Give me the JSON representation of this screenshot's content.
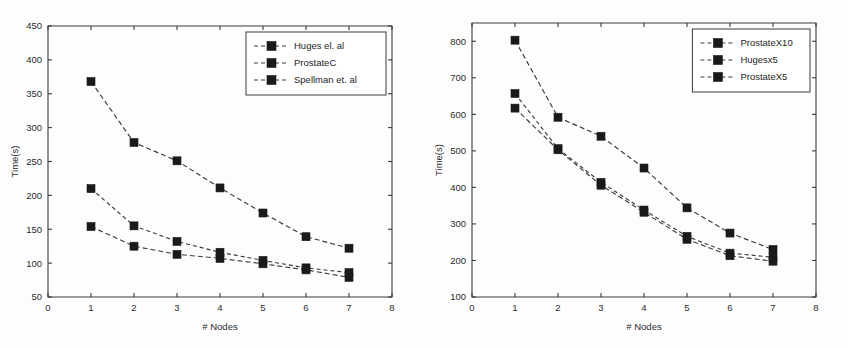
{
  "figure": {
    "background": "#fdfdfd",
    "panel_count": 2
  },
  "chart_data": [
    {
      "id": "left",
      "type": "line",
      "title": "",
      "subtitle": "",
      "xlabel": "# Nodes",
      "ylabel": "Time(s)",
      "xlim": [
        0,
        8
      ],
      "ylim": [
        50,
        450
      ],
      "xticks": [
        0,
        1,
        2,
        3,
        4,
        5,
        6,
        7,
        8
      ],
      "xtick_labels": [
        "0",
        "1",
        "2",
        "3",
        "4",
        "5",
        "6",
        "7",
        "8"
      ],
      "yticks": [
        50,
        100,
        150,
        200,
        250,
        300,
        350,
        400,
        450
      ],
      "ytick_labels": [
        "50",
        "100",
        "150",
        "200",
        "250",
        "300",
        "350",
        "400",
        "450"
      ],
      "grid": false,
      "legend_position": "top-right",
      "x": [
        1,
        2,
        3,
        4,
        5,
        6,
        7
      ],
      "series": [
        {
          "name": "Huges el. al",
          "color": "#3b3b3b",
          "linestyle": "dashed",
          "marker": "square",
          "values": [
            154,
            125,
            113,
            107,
            99,
            90,
            79
          ]
        },
        {
          "name": "ProstateC",
          "color": "#3b3b3b",
          "linestyle": "dashed",
          "marker": "square",
          "values": [
            210,
            155,
            132,
            116,
            104,
            93,
            86
          ]
        },
        {
          "name": "Spellman et. al",
          "color": "#3b3b3b",
          "linestyle": "dashed",
          "marker": "square",
          "values": [
            368,
            278,
            251,
            211,
            174,
            139,
            122
          ]
        }
      ]
    },
    {
      "id": "right",
      "type": "line",
      "title": "",
      "subtitle": "",
      "xlabel": "# Nodes",
      "ylabel": "Time(s)",
      "xlim": [
        0,
        8
      ],
      "ylim": [
        100,
        850
      ],
      "xticks": [
        0,
        1,
        2,
        3,
        4,
        5,
        6,
        7,
        8
      ],
      "xtick_labels": [
        "0",
        "1",
        "2",
        "3",
        "4",
        "5",
        "6",
        "7",
        "8"
      ],
      "yticks": [
        100,
        200,
        300,
        400,
        500,
        600,
        700,
        800
      ],
      "ytick_labels": [
        "100",
        "200",
        "300",
        "400",
        "500",
        "600",
        "700",
        "800"
      ],
      "grid": false,
      "legend_position": "top-right",
      "x": [
        1,
        2,
        3,
        4,
        5,
        6,
        7
      ],
      "series": [
        {
          "name": "ProstateX10",
          "color": "#3b3b3b",
          "linestyle": "dashed",
          "marker": "square",
          "values": [
            803,
            592,
            540,
            453,
            344,
            275,
            230
          ]
        },
        {
          "name": "Hugesx5",
          "color": "#3b3b3b",
          "linestyle": "dashed",
          "marker": "square",
          "values": [
            657,
            506,
            414,
            338,
            266,
            220,
            209
          ]
        },
        {
          "name": "ProstateX5",
          "color": "#3b3b3b",
          "linestyle": "dashed",
          "marker": "square",
          "values": [
            617,
            503,
            406,
            332,
            258,
            213,
            198
          ]
        }
      ]
    }
  ]
}
